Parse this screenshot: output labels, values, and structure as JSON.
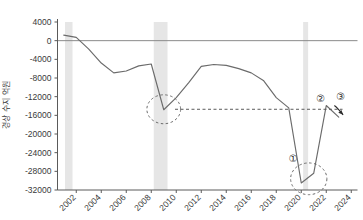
{
  "chart_data": {
    "type": "line",
    "title": "",
    "xlabel": "",
    "ylabel": "경상 수지 억원",
    "ylim": [
      -32000,
      4000
    ],
    "xlim": [
      2000.5,
      2024.5
    ],
    "grid": false,
    "legend": "none",
    "zero_line": 0,
    "yticks": [
      "4000",
      "0",
      "-4000",
      "-8000",
      "-12000",
      "-16000",
      "-20000",
      "-24000",
      "-28000",
      "-32000"
    ],
    "ytick_values": [
      4000,
      0,
      -4000,
      -8000,
      -12000,
      -16000,
      -20000,
      -24000,
      -28000,
      -32000
    ],
    "xticks": [
      "2002",
      "2004",
      "2006",
      "2008",
      "2010",
      "2012",
      "2014",
      "2016",
      "2018",
      "2020",
      "2022",
      "2024"
    ],
    "xtick_values": [
      2002,
      2004,
      2006,
      2008,
      2010,
      2012,
      2014,
      2016,
      2018,
      2020,
      2022,
      2024
    ],
    "series": [
      {
        "name": "경상 수지",
        "color": "#6b6b6b",
        "x": [
          2001,
          2002,
          2003,
          2004,
          2005,
          2006,
          2007,
          2008,
          2009,
          2010,
          2011,
          2012,
          2013,
          2014,
          2015,
          2016,
          2017,
          2018,
          2019,
          2020,
          2021,
          2022,
          2023
        ],
        "values": [
          1200,
          700,
          -1800,
          -4800,
          -6900,
          -6500,
          -5400,
          -5000,
          -14800,
          -12200,
          -9000,
          -5500,
          -5100,
          -5300,
          -6000,
          -6900,
          -8600,
          -12200,
          -14400,
          -30500,
          -28400,
          -13900,
          -16400
        ]
      }
    ],
    "recession_bands": [
      {
        "start": 2001.1,
        "end": 2001.7
      },
      {
        "start": 2008.2,
        "end": 2009.3
      },
      {
        "start": 2020.15,
        "end": 2020.55
      }
    ],
    "annotations": {
      "dashed_circles": [
        {
          "name": "gfc-trough-circle",
          "cx": 2009,
          "cy": -14700,
          "rx": 1.35,
          "ry": 3100
        },
        {
          "name": "covid-trough-circle",
          "cx": 2020.6,
          "cy": -29600,
          "rx": 1.45,
          "ry": 3400
        }
      ],
      "dashed_hline": {
        "name": "gfc-level-reference",
        "y": -14700,
        "x_start": 2009.9,
        "x_end": 2023.3
      },
      "markers": [
        {
          "label": "①",
          "name": "marker-1",
          "x": 2019.35,
          "y": -26100
        },
        {
          "label": "②",
          "name": "marker-2",
          "x": 2021.55,
          "y": -13100
        },
        {
          "label": "③",
          "name": "marker-3",
          "x": 2023.15,
          "y": -12700
        }
      ],
      "arrow": {
        "name": "trend-arrow",
        "from_x": 2022.65,
        "from_y": -13900,
        "to_x": 2023.35,
        "to_y": -15900
      }
    }
  }
}
